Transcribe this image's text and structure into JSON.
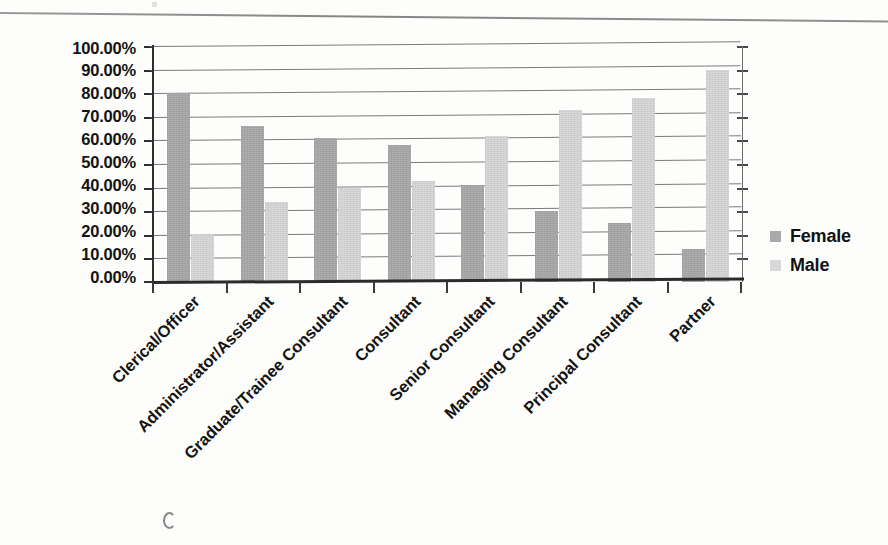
{
  "document": {
    "type": "scanned-report-figure",
    "top_rule": "horizontal-rule"
  },
  "legend": {
    "position": "right",
    "items": [
      {
        "label": "Female",
        "color": "#a9a9a9",
        "swatch": "female-swatch"
      },
      {
        "label": "Male",
        "color": "#d8d8d8",
        "swatch": "male-swatch"
      }
    ]
  },
  "axes": {
    "y_ticks": [
      "100.00%",
      "90.00%",
      "80.00%",
      "70.00%",
      "60.00%",
      "50.00%",
      "40.00%",
      "30.00%",
      "20.00%",
      "10.00%",
      "0.00%"
    ],
    "y_min": 0,
    "y_max": 100
  },
  "chart_data": {
    "type": "bar",
    "title": "",
    "subtitle": "",
    "xlabel": "",
    "ylabel": "",
    "ylim": [
      0,
      100
    ],
    "y_tick_step": 10,
    "y_tick_format": "0.00%",
    "grid": true,
    "legend_position": "right",
    "orientation": "vertical",
    "grouping": "grouped",
    "categories": [
      "Clerical/Officer",
      "Administrator/Assistant",
      "Graduate/Trainee Consultant",
      "Consultant",
      "Senior Consultant",
      "Managing Consultant",
      "Principal Consultant",
      "Partner"
    ],
    "series": [
      {
        "name": "Female",
        "color": "#a9a9a9",
        "values": [
          80.0,
          66.0,
          61.0,
          58.0,
          41.0,
          30.0,
          25.0,
          14.0
        ]
      },
      {
        "name": "Male",
        "color": "#d8d8d8",
        "values": [
          20.0,
          34.0,
          40.0,
          43.0,
          62.0,
          73.0,
          78.0,
          90.0
        ]
      }
    ]
  }
}
